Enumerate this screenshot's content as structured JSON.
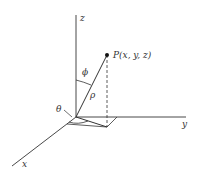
{
  "diagram": {
    "axes": {
      "z": "z",
      "y": "y",
      "x": "x"
    },
    "point_label": "P(x, y, z)",
    "angles": {
      "phi": "ϕ",
      "theta": "θ"
    },
    "radius": "ρ",
    "colors": {
      "line": "#333333",
      "background": "#ffffff"
    }
  }
}
